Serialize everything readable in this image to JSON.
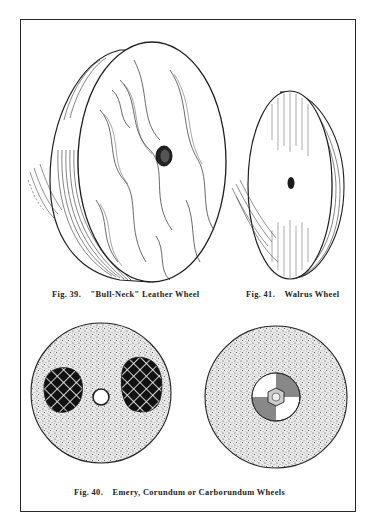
{
  "page": {
    "type": "book plate illustration",
    "frame_color": "#2a2a2a",
    "background": "#ffffff"
  },
  "figures": [
    {
      "id": "fig39",
      "label": "Fig. 39.",
      "title": "\"Bull-Neck\" Leather Wheel",
      "depiction": "wheel-leather-wood-grain"
    },
    {
      "id": "fig41",
      "label": "Fig. 41.",
      "title": "Walrus Wheel",
      "depiction": "wheel-walrus-thin-disc"
    },
    {
      "id": "fig40",
      "label": "Fig. 40.",
      "title": "Emery, Corundum or Carborundum Wheels",
      "depiction": "two-stippled-abrasive-wheels",
      "variants": [
        {
          "name": "wheel-with-crosshatch-patches",
          "hub": "round-hole"
        },
        {
          "name": "wheel-with-flange-hub",
          "hub": "hex-nut-quartered-flange"
        }
      ]
    }
  ]
}
